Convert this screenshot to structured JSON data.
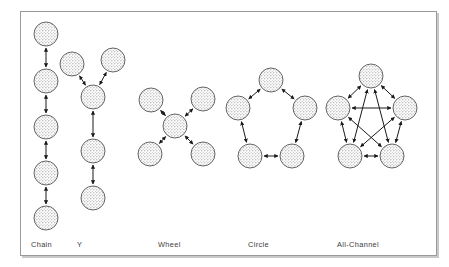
{
  "figure": {
    "background_color": "#ffffff",
    "frame_color": "#9a9a9a",
    "node_fill_color": "#d8d8d8",
    "node_stroke_color": "#555555",
    "edge_color": "#1a1a1a",
    "label_color": "#3b3b3b"
  },
  "labels": {
    "chain": "Chain",
    "y": "Y",
    "wheel": "Wheel",
    "circle": "Circle",
    "all_channel": "All-Channel"
  },
  "chart_data": {
    "type": "diagram",
    "diagram_kind": "node-link-graphs",
    "edge_style": "double-headed-arrow",
    "node_count_per_pattern": 5,
    "patterns": [
      {
        "name": "Chain",
        "label": "Chain",
        "label_x": 31,
        "label_y": 246,
        "node_count": 5,
        "edge_count": 4,
        "nodes": [
          {
            "id": "c1",
            "x": 46,
            "y": 34
          },
          {
            "id": "c2",
            "x": 46,
            "y": 81
          },
          {
            "id": "c3",
            "x": 46,
            "y": 127
          },
          {
            "id": "c4",
            "x": 46,
            "y": 173
          },
          {
            "id": "c5",
            "x": 46,
            "y": 218
          }
        ],
        "edges": [
          {
            "from": "c1",
            "to": "c2"
          },
          {
            "from": "c2",
            "to": "c3"
          },
          {
            "from": "c3",
            "to": "c4"
          },
          {
            "from": "c4",
            "to": "c5"
          }
        ]
      },
      {
        "name": "Y",
        "label": "Y",
        "label_x": 77,
        "label_y": 246,
        "node_count": 5,
        "edge_count": 4,
        "nodes": [
          {
            "id": "y1",
            "x": 72,
            "y": 64
          },
          {
            "id": "y2",
            "x": 113,
            "y": 60
          },
          {
            "id": "y3",
            "x": 93,
            "y": 97
          },
          {
            "id": "y4",
            "x": 93,
            "y": 151
          },
          {
            "id": "y5",
            "x": 93,
            "y": 198
          }
        ],
        "edges": [
          {
            "from": "y1",
            "to": "y3"
          },
          {
            "from": "y2",
            "to": "y3"
          },
          {
            "from": "y3",
            "to": "y4"
          },
          {
            "from": "y4",
            "to": "y5"
          }
        ]
      },
      {
        "name": "Wheel",
        "label": "Wheel",
        "label_x": 158,
        "label_y": 246,
        "node_count": 5,
        "edge_count": 4,
        "nodes": [
          {
            "id": "w0",
            "x": 175,
            "y": 126
          },
          {
            "id": "w1",
            "x": 151,
            "y": 100
          },
          {
            "id": "w2",
            "x": 203,
            "y": 99
          },
          {
            "id": "w3",
            "x": 150,
            "y": 154
          },
          {
            "id": "w4",
            "x": 203,
            "y": 154
          }
        ],
        "edges": [
          {
            "from": "w0",
            "to": "w1"
          },
          {
            "from": "w0",
            "to": "w2"
          },
          {
            "from": "w0",
            "to": "w3"
          },
          {
            "from": "w0",
            "to": "w4"
          }
        ]
      },
      {
        "name": "Circle",
        "label": "Circle",
        "label_x": 248,
        "label_y": 246,
        "node_count": 5,
        "edge_count": 5,
        "nodes": [
          {
            "id": "r1",
            "x": 271,
            "y": 80
          },
          {
            "id": "r2",
            "x": 238,
            "y": 108
          },
          {
            "id": "r3",
            "x": 305,
            "y": 108
          },
          {
            "id": "r4",
            "x": 250,
            "y": 156
          },
          {
            "id": "r5",
            "x": 292,
            "y": 156
          }
        ],
        "edges": [
          {
            "from": "r1",
            "to": "r2"
          },
          {
            "from": "r1",
            "to": "r3"
          },
          {
            "from": "r2",
            "to": "r4"
          },
          {
            "from": "r3",
            "to": "r5"
          },
          {
            "from": "r4",
            "to": "r5"
          }
        ]
      },
      {
        "name": "All-Channel",
        "label": "All-Channel",
        "label_x": 337,
        "label_y": 246,
        "node_count": 5,
        "edge_count": 10,
        "nodes": [
          {
            "id": "a1",
            "x": 371,
            "y": 76
          },
          {
            "id": "a2",
            "x": 338,
            "y": 108
          },
          {
            "id": "a3",
            "x": 405,
            "y": 108
          },
          {
            "id": "a4",
            "x": 350,
            "y": 156
          },
          {
            "id": "a5",
            "x": 392,
            "y": 156
          }
        ],
        "edges": [
          {
            "from": "a1",
            "to": "a2"
          },
          {
            "from": "a1",
            "to": "a3"
          },
          {
            "from": "a1",
            "to": "a4"
          },
          {
            "from": "a1",
            "to": "a5"
          },
          {
            "from": "a2",
            "to": "a3"
          },
          {
            "from": "a2",
            "to": "a4"
          },
          {
            "from": "a2",
            "to": "a5"
          },
          {
            "from": "a3",
            "to": "a4"
          },
          {
            "from": "a3",
            "to": "a5"
          },
          {
            "from": "a4",
            "to": "a5"
          }
        ]
      }
    ],
    "node_radius": 12
  }
}
